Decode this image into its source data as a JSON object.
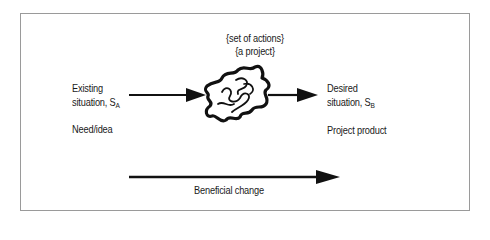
{
  "diagram": {
    "top_label_1": "{set of actions}",
    "top_label_2": "{a project}",
    "left_label_line1": "Existing",
    "left_label_line2": "situation, S",
    "left_label_sub": "A",
    "left_caption": "Need/idea",
    "right_label_line1": "Desired",
    "right_label_line2": "situation, S",
    "right_label_sub": "B",
    "right_caption": "Project product",
    "bottom_label": "Beneficial change"
  }
}
